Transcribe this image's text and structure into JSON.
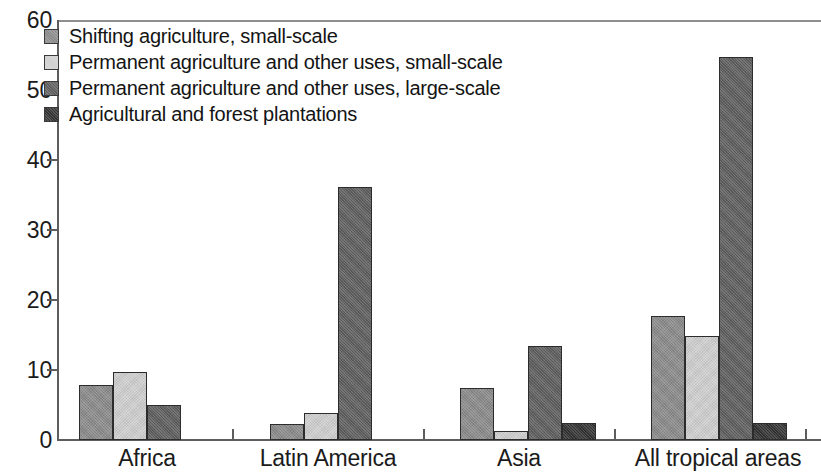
{
  "chart_data": {
    "type": "bar",
    "title": "",
    "subtitle": "",
    "xlabel": "",
    "ylabel": "",
    "ylim": [
      0,
      60
    ],
    "yticks": [
      0,
      10,
      20,
      30,
      40,
      50,
      60
    ],
    "ytick_labels": [
      "0",
      "10",
      "20",
      "30",
      "40",
      "50",
      "60"
    ],
    "grid": false,
    "legend_position": "top-left",
    "categories": [
      "Africa",
      "Latin America",
      "Asia",
      "All tropical areas"
    ],
    "series": [
      {
        "name": "Shifting agriculture, small-scale",
        "color": "#8a8a8a",
        "values": [
          7.9,
          2.3,
          7.5,
          17.7
        ]
      },
      {
        "name": "Permanent agriculture and other uses, small-scale",
        "color": "#cfcfcf",
        "values": [
          9.7,
          3.9,
          1.3,
          14.9
        ]
      },
      {
        "name": "Permanent agriculture and other uses, large-scale",
        "color": "#5e5e5e",
        "values": [
          5.0,
          36.1,
          13.4,
          54.7
        ]
      },
      {
        "name": "Agricultural and forest plantations",
        "color": "#333333",
        "values": [
          0.0,
          0.0,
          2.4,
          2.4
        ]
      }
    ]
  },
  "legend": {
    "items": [
      {
        "label": "Shifting agriculture, small-scale",
        "swatch": "legend-swatch-shifting-agriculture"
      },
      {
        "label": "Permanent agriculture and other uses, small-scale",
        "swatch": "legend-swatch-permanent-small"
      },
      {
        "label": "Permanent agriculture and other uses, large-scale",
        "swatch": "legend-swatch-permanent-large"
      },
      {
        "label": "Agricultural and forest plantations",
        "swatch": "legend-swatch-plantations"
      }
    ]
  },
  "axes": {
    "y_labels": [
      "60",
      "50",
      "40",
      "30",
      "20",
      "10",
      "0"
    ],
    "x_labels": [
      "Africa",
      "Latin America",
      "Asia",
      "All tropical areas"
    ]
  }
}
